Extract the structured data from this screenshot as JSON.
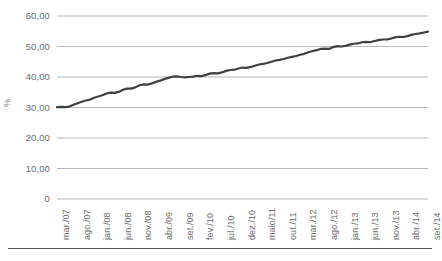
{
  "chart_data": {
    "type": "line",
    "title": "",
    "xlabel": "",
    "ylabel": "%",
    "ylim": [
      0,
      60
    ],
    "ytick_labels": [
      "60,00",
      "50,00",
      "40,00",
      "30,00",
      "20,00",
      "10,00",
      "0"
    ],
    "ytick_values": [
      60,
      50,
      40,
      30,
      20,
      10,
      0
    ],
    "grid": true,
    "legend": "none",
    "line_color": "#404040",
    "grid_color": "#b7b7b7",
    "x_tick_labels": [
      "mar./07",
      "ago./07",
      "jan./08",
      "jun./08",
      "nov./08",
      "abr./09",
      "set./09",
      "fev./10",
      "jul./10",
      "dez./10",
      "maio/11",
      "out./11",
      "mar./12",
      "ago./12",
      "jan./13",
      "jun./13",
      "nov./13",
      "abr./14",
      "set./14"
    ],
    "x_tick_step_months": 5,
    "x_start": "mar./07",
    "x_end": "set./14",
    "n_points": 91,
    "values": [
      30.1,
      30.2,
      30.1,
      30.3,
      30.9,
      31.4,
      31.9,
      32.3,
      32.6,
      33.2,
      33.6,
      34.0,
      34.6,
      34.9,
      34.8,
      35.1,
      35.8,
      36.2,
      36.2,
      36.6,
      37.3,
      37.6,
      37.5,
      37.9,
      38.4,
      38.8,
      39.3,
      39.7,
      40.1,
      40.2,
      40.0,
      39.9,
      40.0,
      40.1,
      40.4,
      40.3,
      40.6,
      41.1,
      41.3,
      41.2,
      41.5,
      42.0,
      42.3,
      42.4,
      42.8,
      43.1,
      43.0,
      43.3,
      43.7,
      44.1,
      44.3,
      44.6,
      45.0,
      45.4,
      45.6,
      45.9,
      46.3,
      46.6,
      46.9,
      47.3,
      47.6,
      48.1,
      48.5,
      48.8,
      49.2,
      49.3,
      49.2,
      49.8,
      50.1,
      50.0,
      50.2,
      50.6,
      50.9,
      51.0,
      51.4,
      51.5,
      51.4,
      51.8,
      52.1,
      52.3,
      52.3,
      52.6,
      53.0,
      53.2,
      53.1,
      53.4,
      53.8,
      54.1,
      54.3,
      54.6,
      54.9
    ]
  }
}
